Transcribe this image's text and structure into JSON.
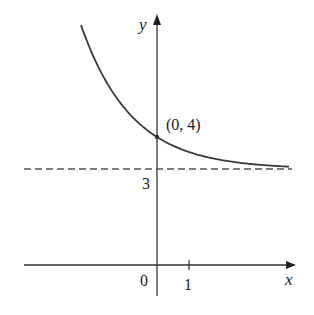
{
  "chart_data": {
    "type": "line",
    "title": "",
    "xlabel": "x",
    "ylabel": "y",
    "function_hint": "y = 3 + e^(-kx), decreasing exponential approaching horizontal asymptote y = 3",
    "k": 0.633,
    "x_range": [
      -2.375,
      4.125
    ],
    "series": [
      {
        "name": "curve",
        "x": [
          -2.375,
          -2,
          -1.5,
          -1,
          -0.5,
          0,
          0.5,
          1,
          1.5,
          2,
          2.5,
          3,
          3.5,
          4,
          4.125
        ],
        "y": [
          7.5,
          6.55,
          5.58,
          4.88,
          4.37,
          4.0,
          3.73,
          3.53,
          3.39,
          3.28,
          3.21,
          3.15,
          3.11,
          3.08,
          3.07
        ]
      }
    ],
    "asymptote": {
      "y": 3,
      "style": "dashed",
      "label": "3"
    },
    "highlight_point": {
      "x": 0,
      "y": 4,
      "label": "(0, 4)"
    },
    "ticks": {
      "x": [
        {
          "value": 1,
          "label": "1"
        }
      ],
      "origin_label": "0"
    },
    "axis_ranges": {
      "x": [
        -4.2,
        4.4
      ],
      "y": [
        -1,
        8.2
      ]
    },
    "grid": false,
    "legend": null
  },
  "labels": {
    "x_axis": "x",
    "y_axis": "y",
    "origin": "0",
    "tick_x1": "1",
    "asymptote": "3",
    "point": "(0, 4)"
  }
}
